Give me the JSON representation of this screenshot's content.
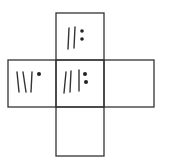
{
  "diagram": {
    "type": "cube-net",
    "stroke_color": "#333333",
    "dot_color": "#222222",
    "background": "#ffffff",
    "cells": [
      {
        "id": "top",
        "position": "top",
        "x": 56,
        "y": 13,
        "w": 48,
        "h": 47,
        "symbol": {
          "lines": 2,
          "dots": 2,
          "dot_layout": "vertical-pair",
          "line_slant": "upright"
        }
      },
      {
        "id": "left",
        "position": "left",
        "x": 8,
        "y": 60,
        "w": 48,
        "h": 47,
        "symbol": {
          "lines": 3,
          "dots": 1,
          "dot_layout": "single-top",
          "line_slant": "leaning"
        }
      },
      {
        "id": "center",
        "position": "center",
        "x": 56,
        "y": 60,
        "w": 48,
        "h": 47,
        "symbol": {
          "lines": 3,
          "dots": 2,
          "dot_layout": "vertical-pair",
          "line_slant": "mixed"
        }
      },
      {
        "id": "right",
        "position": "right",
        "x": 104,
        "y": 60,
        "w": 50,
        "h": 47,
        "symbol": null
      },
      {
        "id": "bottom",
        "position": "bottom",
        "x": 56,
        "y": 107,
        "w": 48,
        "h": 49,
        "symbol": null
      }
    ]
  }
}
